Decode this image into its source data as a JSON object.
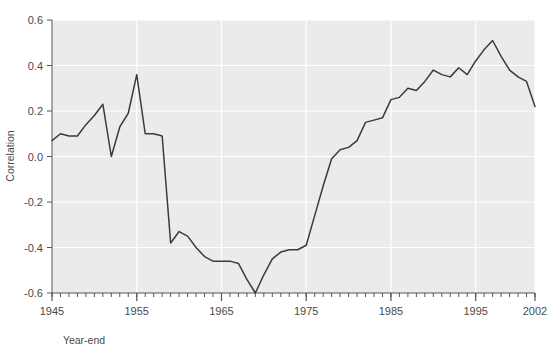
{
  "chart_data": {
    "type": "line",
    "title": "",
    "xlabel": "Year-end",
    "ylabel": "Correlation",
    "xlim": [
      1945,
      2002
    ],
    "ylim": [
      -0.6,
      0.6
    ],
    "grid": true,
    "legend": "none",
    "x_ticks_major": [
      1945,
      1955,
      1965,
      1975,
      1985,
      1995,
      2002
    ],
    "x_tick_labels": [
      "1945",
      "1955",
      "1965",
      "1975",
      "1985",
      "1995",
      "2002"
    ],
    "x_ticks_minor_step": 1,
    "y_ticks": [
      -0.6,
      -0.4,
      -0.2,
      0.0,
      0.2,
      0.4,
      0.6
    ],
    "y_tick_labels": [
      "-0.6",
      "-0.4",
      "-0.2",
      "0.0",
      "0.2",
      "0.4",
      "0.6"
    ],
    "series": [
      {
        "name": "Correlation",
        "color": "#3b3b3b",
        "x": [
          1945,
          1946,
          1947,
          1948,
          1949,
          1950,
          1951,
          1952,
          1953,
          1954,
          1955,
          1956,
          1957,
          1958,
          1959,
          1960,
          1961,
          1962,
          1963,
          1964,
          1965,
          1966,
          1967,
          1968,
          1969,
          1970,
          1971,
          1972,
          1973,
          1974,
          1975,
          1976,
          1977,
          1978,
          1979,
          1980,
          1981,
          1982,
          1983,
          1984,
          1985,
          1986,
          1987,
          1988,
          1989,
          1990,
          1991,
          1992,
          1993,
          1994,
          1995,
          1996,
          1997,
          1998,
          1999,
          2000,
          2001,
          2002
        ],
        "values": [
          0.07,
          0.1,
          0.09,
          0.09,
          0.14,
          0.18,
          0.23,
          0.0,
          0.13,
          0.19,
          0.36,
          0.1,
          0.1,
          0.09,
          -0.38,
          -0.33,
          -0.35,
          -0.4,
          -0.44,
          -0.46,
          -0.46,
          -0.46,
          -0.47,
          -0.54,
          -0.6,
          -0.52,
          -0.45,
          -0.42,
          -0.41,
          -0.41,
          -0.39,
          -0.26,
          -0.13,
          -0.01,
          0.03,
          0.04,
          0.07,
          0.15,
          0.16,
          0.17,
          0.25,
          0.26,
          0.3,
          0.29,
          0.33,
          0.38,
          0.36,
          0.35,
          0.39,
          0.36,
          0.42,
          0.47,
          0.51,
          0.44,
          0.38,
          0.35,
          0.33,
          0.22
        ]
      }
    ]
  },
  "plot": {
    "background_color": "#ebebeb",
    "grid_color": "#ffffff",
    "axis_color": "#555555",
    "line_color": "#3b3b3b",
    "page_background": "#ffffff"
  }
}
